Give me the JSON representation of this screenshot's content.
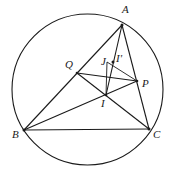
{
  "diagram": {
    "type": "geometry-figure",
    "circle": {
      "cx": 87.5,
      "cy": 89.5,
      "r": 75.5
    },
    "points": {
      "A": {
        "x": 122,
        "y": 25,
        "label": "A",
        "lx": 122,
        "ly": 13
      },
      "B": {
        "x": 24,
        "y": 130,
        "label": "B",
        "lx": 12,
        "ly": 138
      },
      "C": {
        "x": 149,
        "y": 129,
        "label": "C",
        "lx": 153,
        "ly": 138
      },
      "Q": {
        "x": 77,
        "y": 73,
        "label": "Q",
        "lx": 65,
        "ly": 68
      },
      "P": {
        "x": 137,
        "y": 81,
        "label": "P",
        "lx": 142,
        "ly": 87
      },
      "I": {
        "x": 106,
        "y": 95,
        "label": "I",
        "lx": 101,
        "ly": 107
      },
      "J": {
        "x": 107,
        "y": 62,
        "label": "J",
        "lx": 101,
        "ly": 65
      },
      "I_prime": {
        "x": 113,
        "y": 62,
        "label": "I'",
        "lx": 116,
        "ly": 62
      }
    },
    "segments": [
      [
        "A",
        "B"
      ],
      [
        "A",
        "C"
      ],
      [
        "B",
        "C"
      ],
      [
        "B",
        "P"
      ],
      [
        "Q",
        "C"
      ],
      [
        "Q",
        "P"
      ],
      [
        "A",
        "I"
      ],
      [
        "J",
        "I"
      ],
      [
        "J",
        "P"
      ],
      [
        "I",
        "P"
      ]
    ],
    "colors": {
      "stroke": "#1a1a1a",
      "background": "#ffffff"
    }
  }
}
